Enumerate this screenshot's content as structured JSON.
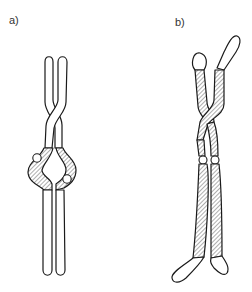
{
  "figure": {
    "panels": [
      {
        "id": "a",
        "label": "a)",
        "description": "Paired chromatids crossed near top, hatched bulging regions with centromeres in middle, long unhatched lower arms"
      },
      {
        "id": "b",
        "label": "b)",
        "description": "Paired chromatids with hatched bodies twisted near top, centromeres at middle, unhatched rounded end caps bent outward"
      }
    ]
  },
  "colors": {
    "stroke": "#1a1a1a",
    "fill": "#ffffff",
    "label": "#333333"
  }
}
